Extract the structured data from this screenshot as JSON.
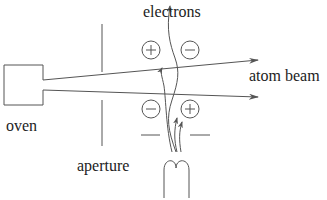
{
  "diagram": {
    "labels": {
      "electrons": "electrons",
      "atom_beam": "atom beam",
      "oven": "oven",
      "aperture": "aperture"
    },
    "charges": [
      {
        "sign": "+",
        "position": "upper-left"
      },
      {
        "sign": "−",
        "position": "upper-right"
      },
      {
        "sign": "−",
        "position": "lower-left"
      },
      {
        "sign": "+",
        "position": "lower-right"
      }
    ],
    "colors": {
      "stroke": "#555555",
      "text": "#222222",
      "background": "#ffffff"
    }
  }
}
